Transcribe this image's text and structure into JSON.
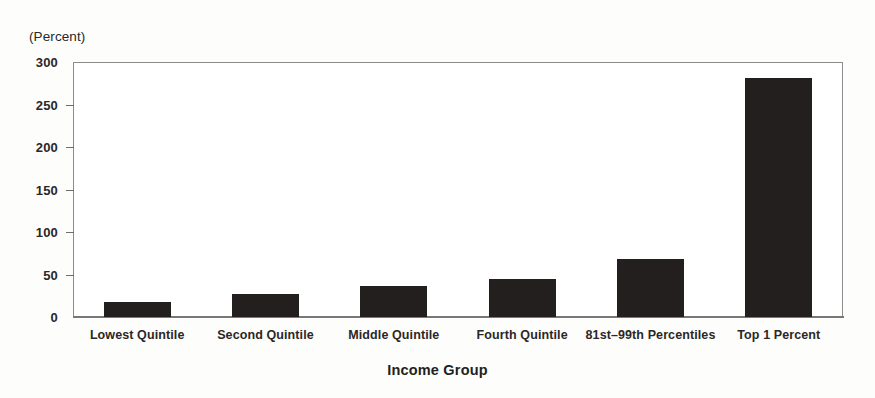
{
  "chart_data": {
    "type": "bar",
    "title": "",
    "unit_caption": "(Percent)",
    "xlabel": "Income Group",
    "ylabel": "",
    "categories": [
      "Lowest Quintile",
      "Second Quintile",
      "Middle Quintile",
      "Fourth Quintile",
      "81st–99th Percentiles",
      "Top 1 Percent"
    ],
    "values": [
      18,
      27,
      36,
      45,
      68,
      281
    ],
    "ylim": [
      0,
      300
    ],
    "yticks": [
      0,
      50,
      100,
      150,
      200,
      250,
      300
    ],
    "ytick_labels": [
      "0",
      "50",
      "100",
      "150",
      "200",
      "250",
      "300"
    ],
    "grid": false,
    "legend": null,
    "bar_color": "#231f1f",
    "axis_color": "#8c8c8c",
    "text_color": "#231f20",
    "background": "#ffffff"
  }
}
